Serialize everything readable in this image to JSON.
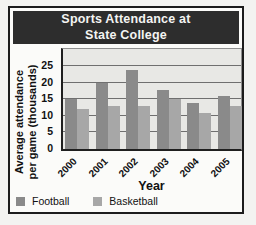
{
  "title": {
    "line1": "Sports Attendance at",
    "line2": "State College"
  },
  "axes": {
    "ylabel_line1": "Average attendance",
    "ylabel_line2": "per game (thousands)",
    "xlabel": "Year"
  },
  "colors": {
    "banner_bg": "#2d2d2d",
    "plot_bg": "#e8e8e5",
    "football": "#8a8a8a",
    "basketball": "#a7a7a7"
  },
  "chart_data": {
    "type": "bar",
    "title": "Sports Attendance at State College",
    "categories": [
      "2000",
      "2001",
      "2002",
      "2003",
      "2004",
      "2005"
    ],
    "series": [
      {
        "name": "Football",
        "color": "#8a8a8a",
        "values": [
          15,
          20,
          24,
          18,
          14,
          16
        ]
      },
      {
        "name": "Basketball",
        "color": "#a7a7a7",
        "values": [
          12,
          13,
          13,
          15,
          11,
          13
        ]
      }
    ],
    "xlabel": "Year",
    "ylabel": "Average attendance per game (thousands)",
    "ylim": [
      0,
      25
    ],
    "yticks": [
      0,
      5,
      10,
      15,
      20,
      25
    ],
    "grid": true,
    "legend_position": "bottom"
  }
}
